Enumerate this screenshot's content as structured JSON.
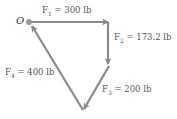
{
  "diagram": {
    "origin_label": "O",
    "forces": [
      {
        "name": "F",
        "sub": "1",
        "value": "= 300 lb"
      },
      {
        "name": "F",
        "sub": "2",
        "value": "= 173.2 lb"
      },
      {
        "name": "F",
        "sub": "3",
        "value": "= 200 lb"
      },
      {
        "name": "F",
        "sub": "4",
        "value": "= 400 lb"
      }
    ],
    "colors": {
      "arrow": "#8a8a8a",
      "text": "#555555",
      "origin_dot": "#9a9a9a"
    }
  }
}
